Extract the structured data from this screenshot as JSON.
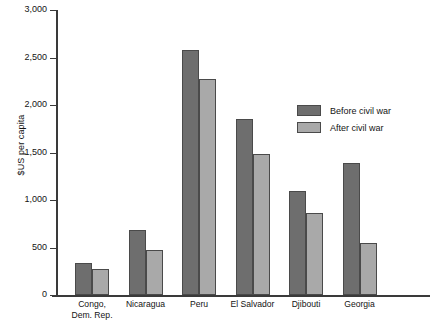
{
  "chart_data": {
    "type": "bar",
    "title": "",
    "xlabel": "",
    "ylabel": "$US per capita",
    "ylim": [
      0,
      3000
    ],
    "yticks": [
      0,
      500,
      1000,
      1500,
      2000,
      2500,
      3000
    ],
    "ytick_labels": [
      "0",
      "500",
      "1,000",
      "1,500",
      "2,000",
      "2,500",
      "3,000"
    ],
    "grid": false,
    "legend_position": "upper right",
    "categories": [
      "Congo, Dem. Rep.",
      "Nicaragua",
      "Peru",
      "El Salvador",
      "Djibouti",
      "Georgia"
    ],
    "series": [
      {
        "name": "Before civil war",
        "color": "#6e6e6e",
        "values": [
          340,
          680,
          2580,
          1850,
          1090,
          1390
        ]
      },
      {
        "name": "After civil war",
        "color": "#a9a9a9",
        "values": [
          275,
          470,
          2275,
          1485,
          865,
          550
        ]
      }
    ]
  },
  "axis": {
    "y_title": "$US per capita"
  },
  "legend": {
    "items": [
      {
        "label": "Before civil war"
      },
      {
        "label": "After civil war"
      }
    ]
  },
  "categories_display": [
    {
      "line1": "Congo,",
      "line2": "Dem. Rep."
    },
    {
      "line1": "Nicaragua",
      "line2": ""
    },
    {
      "line1": "Peru",
      "line2": ""
    },
    {
      "line1": "El Salvador",
      "line2": ""
    },
    {
      "line1": "Djibouti",
      "line2": ""
    },
    {
      "line1": "Georgia",
      "line2": ""
    }
  ],
  "footer": {
    "caption": ""
  },
  "colors": {
    "before": "#6e6e6e",
    "after": "#a9a9a9",
    "axis": "#3a3a3a",
    "bar_border": "#4a4a4a",
    "text": "#141414",
    "background": "#ffffff"
  }
}
